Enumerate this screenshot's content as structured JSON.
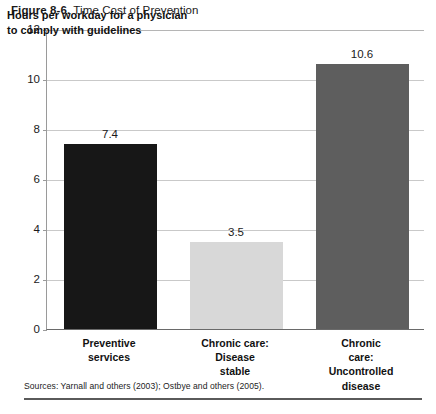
{
  "figure": {
    "number": "Figure 8-6.",
    "title": "Time Cost of Prevention"
  },
  "annotation": "Hours per workday for a physician\nto comply with guidelines",
  "source_note": "Sources: Yarnall and others (2003); Ostbye and others (2005).",
  "chart_data": {
    "type": "bar",
    "title": "Time Cost of Prevention",
    "xlabel": "",
    "ylabel": "",
    "ylim": [
      0,
      12
    ],
    "yticks": [
      0,
      2,
      4,
      6,
      8,
      10,
      12
    ],
    "ytick_labels": [
      "0",
      "2",
      "4",
      "6",
      "8",
      "10",
      "12"
    ],
    "grid": true,
    "legend": "none",
    "categories": [
      "Preventive\nservices",
      "Chronic care:\nDisease\nstable",
      "Chronic care:\nUncontrolled\ndisease"
    ],
    "values": [
      7.4,
      3.5,
      10.6
    ],
    "value_labels": [
      "7.4",
      "3.5",
      "10.6"
    ],
    "bar_colors": [
      "#171717",
      "#d8d8d8",
      "#5e5e5e"
    ]
  }
}
